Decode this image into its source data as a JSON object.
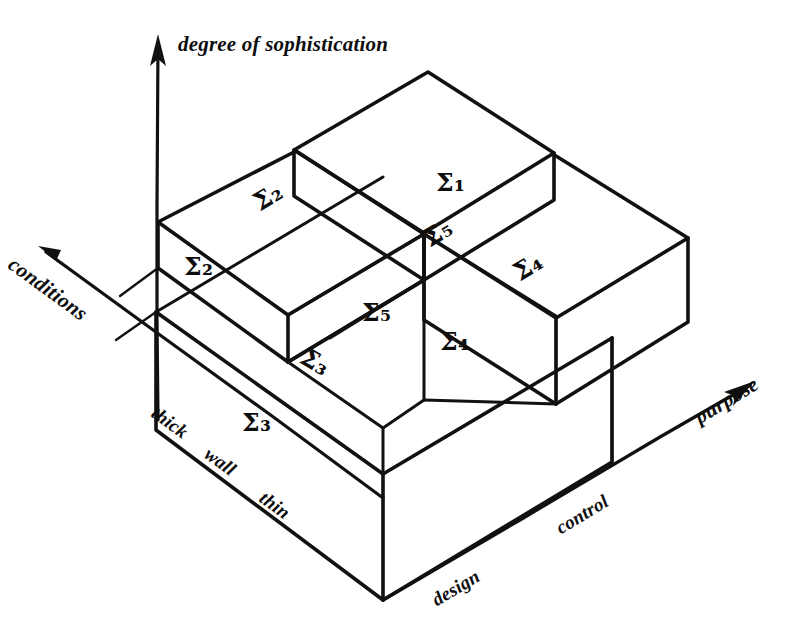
{
  "figure": {
    "kind": "hand-drawn-3d-block-diagram",
    "background_color": "#ffffff",
    "ink_color": "#111111"
  },
  "axes": {
    "vertical": {
      "label": "degree of sophistication",
      "icon": "arrow-up-icon"
    },
    "left": {
      "label": "conditions",
      "icon": "arrow-up-left-icon",
      "ticks": [
        {
          "label": "thick"
        },
        {
          "label": "wall"
        },
        {
          "label": "thin"
        }
      ]
    },
    "right": {
      "label": "purpose",
      "icon": "arrow-up-right-icon",
      "ticks": [
        {
          "label": "design"
        },
        {
          "label": "control"
        }
      ]
    }
  },
  "blocks": [
    {
      "id": "sigma1",
      "top_label": "",
      "face_label": "Σ",
      "face_sub": "1"
    },
    {
      "id": "sigma2",
      "top_label": "Σ",
      "top_sub": "2",
      "face_label": "Σ",
      "face_sub": "2"
    },
    {
      "id": "sigma3",
      "top_label": "Σ",
      "top_sub": "3",
      "face_label": "Σ",
      "face_sub": "3"
    },
    {
      "id": "sigma4",
      "top_label": "Σ",
      "top_sub": "4",
      "face_label": "Σ",
      "face_sub": "4"
    },
    {
      "id": "sigma5",
      "top_label": "Σ",
      "top_sub": "5",
      "face_label": "Σ",
      "face_sub": "5"
    }
  ],
  "labels": {
    "sigma1_face": "Σ₁",
    "sigma2_top": "Σ₂",
    "sigma2_face": "Σ₂",
    "sigma3_top": "Σ₃",
    "sigma3_base": "Σ₃",
    "sigma4_top": "Σ₄",
    "sigma4_face": "Σ₄",
    "sigma5_top": "Σ₅",
    "sigma5_face": "Σ₅"
  }
}
